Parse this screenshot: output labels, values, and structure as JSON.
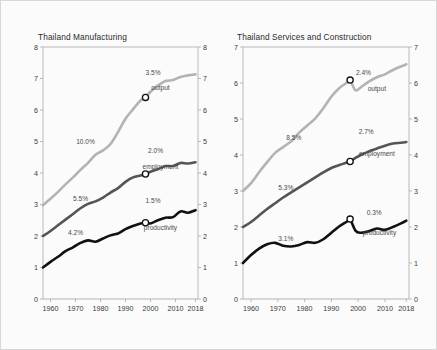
{
  "figure": {
    "background": "#fbfbfb",
    "border_color": "#d8d8d8"
  },
  "colors": {
    "output": "#b3b3b3",
    "employment": "#555555",
    "productivity": "#111111",
    "axis": "#aaaaaa",
    "text": "#3a3a3a"
  },
  "chart_data": [
    {
      "type": "line",
      "title": "Thailand Manufacturing",
      "xlabel": "",
      "ylabel": "",
      "xlim": [
        1957,
        2019
      ],
      "ylim": [
        0,
        8
      ],
      "grid": false,
      "legend": "inline-labels",
      "xticks": [
        "1960",
        "1970",
        "1980",
        "1990",
        "2000",
        "2010",
        "2018"
      ],
      "xtick_values": [
        1960,
        1970,
        1980,
        1990,
        2000,
        2010,
        2018
      ],
      "yticks": [
        "0",
        "1",
        "2",
        "3",
        "4",
        "5",
        "6",
        "7",
        "8"
      ],
      "ytick_values": [
        0,
        1,
        2,
        3,
        4,
        5,
        6,
        7,
        8
      ],
      "yticks_right": [
        "0",
        "1",
        "2",
        "3",
        "4",
        "5",
        "6",
        "7",
        "8"
      ],
      "annotations": [
        {
          "text": "10.0%",
          "series": "output",
          "period": "pre-1998"
        },
        {
          "text": "3.5%",
          "series": "output",
          "period": "post-1998"
        },
        {
          "text": "5.5%",
          "series": "employment",
          "period": "pre-1998"
        },
        {
          "text": "2.0%",
          "series": "employment",
          "period": "post-1998"
        },
        {
          "text": "4.2%",
          "series": "productivity",
          "period": "pre-1998"
        },
        {
          "text": "1.5%",
          "series": "productivity",
          "period": "post-1998"
        }
      ],
      "series": [
        {
          "name": "output",
          "label": "output",
          "color": "#b3b3b3",
          "marker_year": 1998,
          "marker_value": 6.4,
          "x": [
            1957,
            1960,
            1963,
            1966,
            1969,
            1972,
            1975,
            1978,
            1981,
            1984,
            1987,
            1990,
            1993,
            1996,
            1998,
            2000,
            2003,
            2006,
            2009,
            2012,
            2015,
            2018
          ],
          "y": [
            2.98,
            3.18,
            3.4,
            3.64,
            3.86,
            4.1,
            4.32,
            4.58,
            4.72,
            4.92,
            5.3,
            5.72,
            6.02,
            6.3,
            6.4,
            6.58,
            6.78,
            6.92,
            6.95,
            7.05,
            7.1,
            7.13
          ]
        },
        {
          "name": "employment",
          "label": "employment",
          "color": "#555555",
          "marker_year": 1998,
          "marker_value": 3.97,
          "x": [
            1957,
            1960,
            1963,
            1966,
            1969,
            1972,
            1975,
            1978,
            1981,
            1984,
            1987,
            1990,
            1993,
            1996,
            1998,
            2000,
            2003,
            2006,
            2009,
            2012,
            2015,
            2018
          ],
          "y": [
            2.0,
            2.16,
            2.34,
            2.52,
            2.7,
            2.88,
            3.02,
            3.1,
            3.22,
            3.38,
            3.52,
            3.72,
            3.86,
            3.92,
            3.97,
            4.04,
            4.12,
            4.22,
            4.22,
            4.32,
            4.3,
            4.34
          ]
        },
        {
          "name": "productivity",
          "label": "productivity",
          "color": "#111111",
          "marker_year": 1998,
          "marker_value": 2.42,
          "x": [
            1957,
            1960,
            1963,
            1966,
            1969,
            1972,
            1975,
            1978,
            1981,
            1984,
            1987,
            1990,
            1993,
            1996,
            1998,
            2000,
            2003,
            2006,
            2009,
            2012,
            2015,
            2018
          ],
          "y": [
            1.0,
            1.18,
            1.34,
            1.52,
            1.64,
            1.78,
            1.86,
            1.82,
            1.92,
            2.02,
            2.08,
            2.22,
            2.32,
            2.4,
            2.42,
            2.4,
            2.5,
            2.58,
            2.6,
            2.78,
            2.74,
            2.82
          ]
        }
      ]
    },
    {
      "type": "line",
      "title": "Thailand Services and Construction",
      "xlabel": "",
      "ylabel": "",
      "xlim": [
        1957,
        2019
      ],
      "ylim": [
        0,
        7
      ],
      "grid": false,
      "legend": "inline-labels",
      "xticks": [
        "1960",
        "1970",
        "1980",
        "1990",
        "2000",
        "2010",
        "2018"
      ],
      "xtick_values": [
        1960,
        1970,
        1980,
        1990,
        2000,
        2010,
        2018
      ],
      "yticks": [
        "0",
        "1",
        "2",
        "3",
        "4",
        "5",
        "6",
        "7"
      ],
      "ytick_values": [
        0,
        1,
        2,
        3,
        4,
        5,
        6,
        7
      ],
      "yticks_right": [
        "0",
        "1",
        "2",
        "3",
        "4",
        "5",
        "6",
        "7"
      ],
      "annotations": [
        {
          "text": "8.5%",
          "series": "output",
          "period": "pre-1997"
        },
        {
          "text": "2.4%",
          "series": "output",
          "period": "post-1997"
        },
        {
          "text": "5.3%",
          "series": "employment",
          "period": "pre-1997"
        },
        {
          "text": "2.7%",
          "series": "employment",
          "period": "post-1997"
        },
        {
          "text": "3.1%",
          "series": "productivity",
          "period": "pre-1997"
        },
        {
          "text": "0.3%",
          "series": "productivity",
          "period": "post-1997"
        }
      ],
      "series": [
        {
          "name": "output",
          "label": "output",
          "color": "#b3b3b3",
          "marker_year": 1997,
          "marker_value": 6.08,
          "x": [
            1957,
            1960,
            1963,
            1966,
            1969,
            1972,
            1975,
            1978,
            1981,
            1984,
            1987,
            1990,
            1993,
            1996,
            1997,
            1999,
            2001,
            2004,
            2007,
            2010,
            2013,
            2016,
            2018
          ],
          "y": [
            3.0,
            3.22,
            3.52,
            3.8,
            4.06,
            4.22,
            4.38,
            4.62,
            4.82,
            5.02,
            5.3,
            5.62,
            5.86,
            6.02,
            6.08,
            5.8,
            5.88,
            6.04,
            6.16,
            6.24,
            6.36,
            6.46,
            6.52
          ]
        },
        {
          "name": "employment",
          "label": "employment",
          "color": "#555555",
          "marker_year": 1997,
          "marker_value": 3.82,
          "x": [
            1957,
            1960,
            1963,
            1966,
            1969,
            1972,
            1975,
            1978,
            1981,
            1984,
            1987,
            1990,
            1993,
            1996,
            1997,
            1999,
            2001,
            2004,
            2007,
            2010,
            2013,
            2016,
            2018
          ],
          "y": [
            2.0,
            2.14,
            2.32,
            2.5,
            2.66,
            2.82,
            2.96,
            3.1,
            3.24,
            3.38,
            3.52,
            3.64,
            3.72,
            3.8,
            3.82,
            3.92,
            4.0,
            4.1,
            4.18,
            4.26,
            4.32,
            4.34,
            4.36
          ]
        },
        {
          "name": "productivity",
          "label": "productivity",
          "color": "#111111",
          "marker_year": 1997,
          "marker_value": 2.22,
          "x": [
            1957,
            1960,
            1963,
            1966,
            1969,
            1972,
            1975,
            1978,
            1981,
            1984,
            1987,
            1990,
            1993,
            1996,
            1997,
            1999,
            2001,
            2004,
            2007,
            2010,
            2013,
            2016,
            2018
          ],
          "y": [
            1.0,
            1.22,
            1.4,
            1.52,
            1.56,
            1.48,
            1.46,
            1.5,
            1.58,
            1.56,
            1.66,
            1.84,
            2.02,
            2.16,
            2.22,
            1.9,
            1.84,
            1.88,
            1.96,
            1.92,
            2.0,
            2.1,
            2.18
          ]
        }
      ]
    }
  ]
}
